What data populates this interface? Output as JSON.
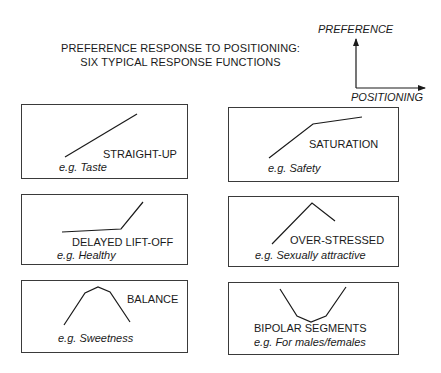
{
  "title": {
    "line1": "PREFERENCE RESPONSE TO POSITIONING:",
    "line2": "SIX TYPICAL RESPONSE FUNCTIONS"
  },
  "axes": {
    "y_label": "PREFERENCE",
    "x_label": "POSITIONING"
  },
  "panels": [
    {
      "name": "STRAIGHT-UP",
      "example": "e.g. Taste",
      "points": "65,157 137,114"
    },
    {
      "name": "SATURATION",
      "example": "e.g. Safety",
      "points": "269,158 313,124 362,117"
    },
    {
      "name": "DELAYED LIFT-OFF",
      "example": "e.g. Healthy",
      "points": "62,232 121,229 143,202"
    },
    {
      "name": "OVER-STRESSED",
      "example": "e.g. Sexually attractive",
      "points": "272,244 312,203 335,221"
    },
    {
      "name": "BALANCE",
      "example": "e.g. Sweetness",
      "points": "64,325 85,293 98,287 110,292 130,322"
    },
    {
      "name": "BIPOLAR SEGMENTS",
      "example": "e.g. For males/females",
      "points": "280,289 297,316 311,322 326,316 346,287"
    }
  ]
}
